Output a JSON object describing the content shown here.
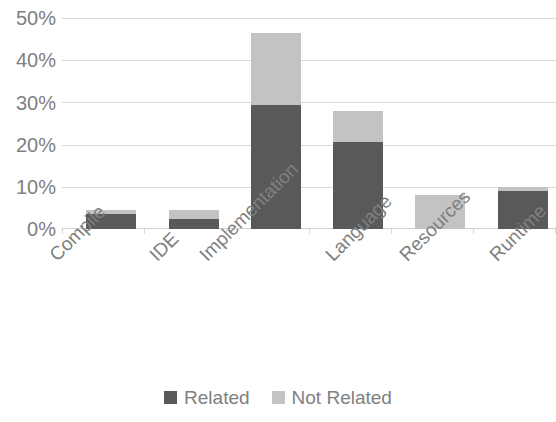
{
  "chart_data": {
    "type": "bar",
    "subtype": "stacked-bar",
    "title": "",
    "subtitle": "",
    "xlabel": "",
    "ylabel": "",
    "categories": [
      "Compile",
      "IDE",
      "Implementation",
      "Language",
      "Resources",
      "Runtime"
    ],
    "series": [
      {
        "name": "Related",
        "color": "#595959",
        "values": [
          3.5,
          2.3,
          29.5,
          20.7,
          0.0,
          9.0
        ]
      },
      {
        "name": "Not Related",
        "color": "#c3c3c3",
        "values": [
          1.0,
          2.2,
          17.0,
          7.3,
          8.0,
          1.0
        ]
      }
    ],
    "totals": [
      4.5,
      4.5,
      46.5,
      28.0,
      8.0,
      10.0
    ],
    "ylim": [
      0,
      50
    ],
    "y_tick_values": [
      0,
      10,
      20,
      30,
      40,
      50
    ],
    "y_tick_labels": [
      "0%",
      "10%",
      "20%",
      "30%",
      "40%",
      "50%"
    ],
    "value_format": "percent",
    "grid": {
      "horizontal": true,
      "vertical": false,
      "color": "#d9d9d9"
    },
    "legend": {
      "position": "bottom",
      "entries": [
        "Related",
        "Not Related"
      ]
    },
    "axis": {
      "x_label_rotation": -45,
      "label_color": "#808080"
    }
  },
  "legend": {
    "items": [
      {
        "label": "Related",
        "color": "#595959"
      },
      {
        "label": "Not Related",
        "color": "#c3c3c3"
      }
    ]
  }
}
